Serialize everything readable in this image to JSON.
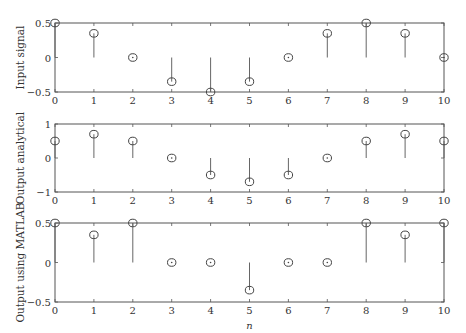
{
  "chart_data": [
    {
      "type": "stem",
      "title": "",
      "xlabel": "",
      "ylabel": "Input signal",
      "x": [
        0,
        1,
        2,
        3,
        4,
        5,
        6,
        7,
        8,
        9,
        10
      ],
      "values": [
        0.5,
        0.35,
        0,
        -0.35,
        -0.5,
        -0.35,
        0,
        0.35,
        0.5,
        0.35,
        0
      ],
      "xlim": [
        0,
        10
      ],
      "ylim": [
        -0.5,
        0.5
      ],
      "yticks": [
        -0.5,
        0,
        0.5
      ],
      "ytick_labels": [
        "−0.5",
        "0",
        "0.5"
      ],
      "xtick_labels": [
        "0",
        "1",
        "2",
        "3",
        "4",
        "5",
        "6",
        "7",
        "8",
        "9",
        "10"
      ],
      "grid": false
    },
    {
      "type": "stem",
      "title": "",
      "xlabel": "",
      "ylabel": "Output analytical",
      "x": [
        0,
        1,
        2,
        3,
        4,
        5,
        6,
        7,
        8,
        9,
        10
      ],
      "values": [
        0.5,
        0.7,
        0.5,
        0,
        -0.5,
        -0.7,
        -0.5,
        0,
        0.5,
        0.7,
        0.5
      ],
      "xlim": [
        0,
        10
      ],
      "ylim": [
        -1,
        1
      ],
      "yticks": [
        -1,
        0,
        1
      ],
      "ytick_labels": [
        "−1",
        "0",
        "1"
      ],
      "xtick_labels": [
        "0",
        "1",
        "2",
        "3",
        "4",
        "5",
        "6",
        "7",
        "8",
        "9",
        "10"
      ],
      "grid": false
    },
    {
      "type": "stem",
      "title": "",
      "xlabel": "n",
      "ylabel": "Output using MATLAB",
      "x": [
        0,
        1,
        2,
        3,
        4,
        5,
        6,
        7,
        8,
        9,
        10
      ],
      "values": [
        0.5,
        0.35,
        0.5,
        0,
        0,
        -0.35,
        0,
        0,
        0.5,
        0.35,
        0.5
      ],
      "xlim": [
        0,
        10
      ],
      "ylim": [
        -0.5,
        0.5
      ],
      "yticks": [
        -0.5,
        0,
        0.5
      ],
      "ytick_labels": [
        "−0.5",
        "0",
        "0.5"
      ],
      "xtick_labels": [
        "0",
        "1",
        "2",
        "3",
        "4",
        "5",
        "6",
        "7",
        "8",
        "9",
        "10"
      ],
      "grid": false
    }
  ],
  "colors": {
    "axis": "#555555",
    "stem": "#666666",
    "marker": "#444444",
    "text": "#333333"
  }
}
